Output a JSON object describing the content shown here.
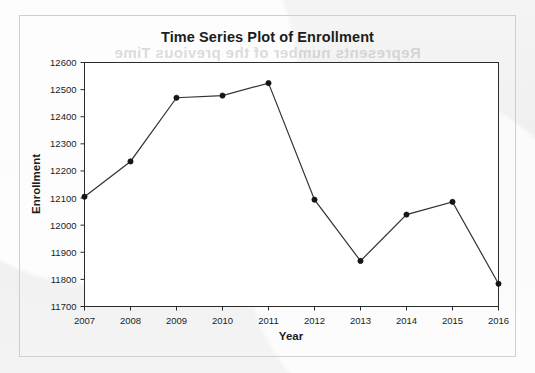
{
  "figure": {
    "title": "Time Series Plot of Enrollment",
    "background_color": "#f2f2f2",
    "plot_background_color": "#ffffff",
    "frame_color": "#2b2b2b",
    "series_color": "#333333",
    "marker_color": "#151515",
    "showthrough_text": "Represents number of the previous Time"
  },
  "chart_data": {
    "type": "line",
    "title": "Time Series Plot of Enrollment",
    "xlabel": "Year",
    "ylabel": "Enrollment",
    "categories": [
      "2007",
      "2008",
      "2009",
      "2010",
      "2011",
      "2012",
      "2013",
      "2014",
      "2015",
      "2016"
    ],
    "x": [
      2007,
      2008,
      2009,
      2010,
      2011,
      2012,
      2013,
      2014,
      2015,
      2016
    ],
    "values": [
      12105,
      12235,
      12470,
      12478,
      12524,
      12094,
      11868,
      12039,
      12086,
      11784
    ],
    "series": [
      {
        "name": "Enrollment",
        "values": [
          12105,
          12235,
          12470,
          12478,
          12524,
          12094,
          11868,
          12039,
          12086,
          11784
        ]
      }
    ],
    "ylim": [
      11700,
      12600
    ],
    "xlim": [
      2007,
      2016
    ],
    "yticks": [
      11700,
      11800,
      11900,
      12000,
      12100,
      12200,
      12300,
      12400,
      12500,
      12600
    ],
    "ytick_labels": [
      "11700",
      "11800",
      "11900",
      "12000",
      "12100",
      "12200",
      "12300",
      "12400",
      "12500",
      "12600"
    ],
    "xticks": [
      2007,
      2008,
      2009,
      2010,
      2011,
      2012,
      2013,
      2014,
      2015,
      2016
    ],
    "xtick_labels": [
      "2007",
      "2008",
      "2009",
      "2010",
      "2011",
      "2012",
      "2013",
      "2014",
      "2015",
      "2016"
    ],
    "grid": false,
    "legend": false,
    "markers": "filled-circle"
  }
}
